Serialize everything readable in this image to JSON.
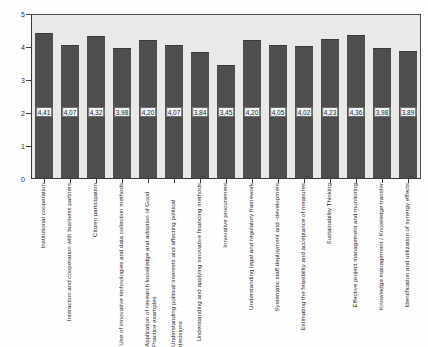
{
  "chart_data": {
    "type": "bar",
    "title": "",
    "subtitle": "",
    "xlabel": "",
    "ylabel": "",
    "ylim": [
      0,
      5
    ],
    "yticks": [
      "0",
      "1",
      "2",
      "3",
      "4",
      "5"
    ],
    "grid": false,
    "legend": "none",
    "orientation": "vertical",
    "value_label_format": "comma-decimal",
    "bar_color": "#4e4e4e",
    "plot_background": "#e9e9e7",
    "axis_color": "#3a3a3a",
    "categories": [
      "Institutional cooperation",
      "Interaction and cooperation with business partners",
      "Citizen participation",
      "Use of innovative technologies and data collection methods",
      "Application of research knowledge and adoption of Good Practice examples",
      "Understanding political interests and affecting political decisions",
      "Understanding and applying innovative financing methods",
      "Innovative procurement",
      "Understanding legal and regulatory framework",
      "Systematic staff deployment and -development",
      "Estimating the feasibility and acceptance of measures",
      "Sustainability Thinking",
      "Effective project management and monitoring",
      "Knowledge management / Knowledge transfer",
      "Identification and utilization of synergy effects"
    ],
    "values": [
      4.41,
      4.07,
      4.32,
      3.98,
      4.2,
      4.07,
      3.84,
      3.45,
      4.2,
      4.05,
      4.02,
      4.23,
      4.36,
      3.98,
      3.89
    ],
    "value_labels": [
      "4,41",
      "4,07",
      "4,32",
      "3,98",
      "4,20",
      "4,07",
      "3,84",
      "3,45",
      "4,20",
      "4,05",
      "4,02",
      "4,23",
      "4,36",
      "3,98",
      "3,89"
    ]
  }
}
